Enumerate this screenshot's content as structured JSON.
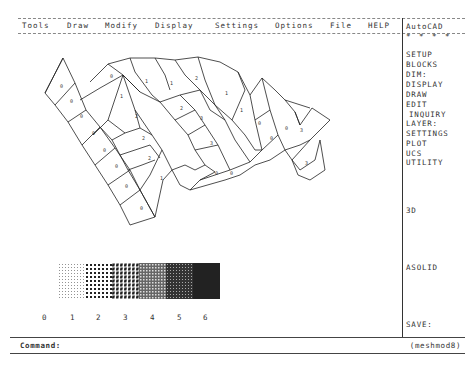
{
  "menubar": {
    "items": [
      "Tools",
      "Draw",
      "Modify",
      "Display",
      "Settings",
      "Options",
      "File",
      "HELP"
    ]
  },
  "sidebar": {
    "title": "AutoCAD",
    "stars": "* * * *",
    "items": [
      "SETUP",
      "BLOCKS",
      "DIM:",
      "DISPLAY",
      "DRAW",
      "EDIT",
      "INQUIRY",
      "LAYER:",
      "SETTINGS",
      "PLOT",
      "UCS",
      "UTILITY"
    ],
    "item_3d": "3D",
    "item_asolid": "ASOLID",
    "item_save": "SAVE:"
  },
  "drawing": {
    "mesh_cell_values": [
      "0",
      "0",
      "0",
      "0",
      "0",
      "0",
      "0",
      "0",
      "0",
      "1",
      "2",
      "2",
      "2",
      "1",
      "1",
      "1",
      "2",
      "2",
      "3",
      "3",
      "1",
      "1",
      "0",
      "0",
      "0",
      "3",
      "3",
      "0",
      "0"
    ],
    "pattern_legend": {
      "labels": [
        "0",
        "1",
        "2",
        "3",
        "4",
        "5",
        "6"
      ]
    }
  },
  "command": {
    "prompt": "Command:",
    "drawing_name": "(meshmod8)"
  }
}
